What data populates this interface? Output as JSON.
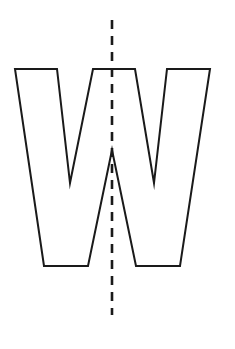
{
  "figure": {
    "canvas": {
      "width": 235,
      "height": 349,
      "background": "#ffffff"
    },
    "shape": {
      "name": "letter-w-outline",
      "glyph": "W",
      "kind": "polygon",
      "fill": "#ffffff",
      "stroke_color": "#1a1a1a",
      "stroke_width": 2,
      "vertices": [
        [
          15,
          69
        ],
        [
          57,
          69
        ],
        [
          70,
          183
        ],
        [
          93,
          69
        ],
        [
          135,
          69
        ],
        [
          154,
          183
        ],
        [
          167,
          69
        ],
        [
          210,
          69
        ],
        [
          180,
          266
        ],
        [
          136,
          266
        ],
        [
          112,
          150
        ],
        [
          88,
          266
        ],
        [
          44,
          266
        ]
      ],
      "key_points": {
        "top_left_outer": [
          15,
          69
        ],
        "top_left_inner": [
          57,
          69
        ],
        "left_valley_tip": [
          70,
          183
        ],
        "top_middle_left": [
          93,
          69
        ],
        "top_middle_right": [
          135,
          69
        ],
        "right_valley_tip": [
          154,
          183
        ],
        "top_right_inner": [
          167,
          69
        ],
        "top_right_outer": [
          210,
          69
        ],
        "bottom_right_outer": [
          180,
          266
        ],
        "bottom_right_inner": [
          136,
          266
        ],
        "center_apex": [
          112,
          150
        ],
        "bottom_left_inner": [
          88,
          266
        ],
        "bottom_left_outer": [
          44,
          266
        ]
      }
    },
    "symmetry_axis": {
      "name": "vertical-line-of-symmetry",
      "orientation": "vertical",
      "x": 112,
      "y_start": 20,
      "y_end": 315,
      "style": "dashed",
      "dash_length": 9,
      "gap_length": 7,
      "stroke_color": "#1a1a1a",
      "stroke_width": 2.6
    }
  }
}
